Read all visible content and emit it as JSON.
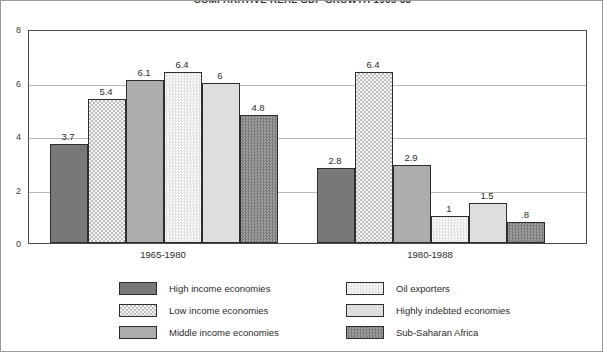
{
  "chart_data": {
    "type": "bar",
    "title": "COMPARATIVE REAL GDP GROWTH 1965-88",
    "xlabel": "",
    "ylabel": "",
    "ylim": [
      0,
      8
    ],
    "yticks": [
      "0",
      "2",
      "4",
      "6",
      "8"
    ],
    "grid": true,
    "legend_position": "bottom",
    "categories": [
      "1965-1980",
      "1980-1988"
    ],
    "series": [
      {
        "name": "High income economies",
        "values": [
          3.7,
          2.8
        ],
        "labels": [
          "3.7",
          "2.8"
        ],
        "color": "#787878",
        "pattern": "solid"
      },
      {
        "name": "Low income economies",
        "values": [
          5.4,
          6.4
        ],
        "labels": [
          "5.4",
          "6.4"
        ],
        "color": "#f0f0f0",
        "pattern": "checker"
      },
      {
        "name": "Middle income economies",
        "values": [
          6.1,
          2.9
        ],
        "labels": [
          "6.1",
          "2.9"
        ],
        "color": "#adadad",
        "pattern": "solid"
      },
      {
        "name": "Oil exporters",
        "values": [
          6.4,
          1.0
        ],
        "labels": [
          "6.4",
          "1"
        ],
        "color": "#f7f7f7",
        "pattern": "fine-dot"
      },
      {
        "name": "Highly indebted economies",
        "values": [
          6.0,
          1.5
        ],
        "labels": [
          "6",
          "1.5"
        ],
        "color": "#dedede",
        "pattern": "solid"
      },
      {
        "name": "Sub-Saharan Africa",
        "values": [
          4.8,
          0.8
        ],
        "labels": [
          "4.8",
          ".8"
        ],
        "color": "#8e8e8e",
        "pattern": "checker-dark"
      }
    ]
  },
  "legend": {
    "left_column": [
      {
        "label": "High income economies",
        "fill_class": "fill-high"
      },
      {
        "label": "Low income economies",
        "fill_class": "fill-low"
      },
      {
        "label": "Middle income economies",
        "fill_class": "fill-middle"
      }
    ],
    "right_column": [
      {
        "label": "Oil exporters",
        "fill_class": "fill-oil"
      },
      {
        "label": "Highly indebted economies",
        "fill_class": "fill-indebted"
      },
      {
        "label": "Sub-Saharan Africa",
        "fill_class": "fill-ssa"
      }
    ]
  }
}
